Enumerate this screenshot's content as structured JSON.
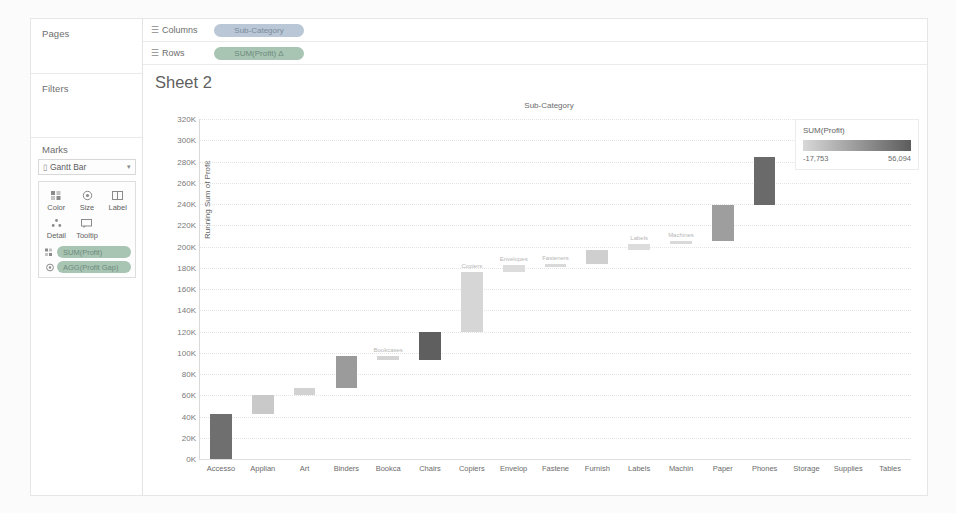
{
  "left_panel": {
    "pages_label": "Pages",
    "filters_label": "Filters",
    "marks_label": "Marks",
    "mark_type": "Gantt Bar",
    "mark_type_icon": "gantt-bar-icon",
    "caret_icon": "▾",
    "buttons": [
      {
        "label": "Color",
        "icon": "color-icon"
      },
      {
        "label": "Size",
        "icon": "size-icon"
      },
      {
        "label": "Label",
        "icon": "label-icon"
      },
      {
        "label": "Detail",
        "icon": "detail-icon"
      },
      {
        "label": "Tooltip",
        "icon": "tooltip-icon"
      }
    ],
    "mark_pills": [
      {
        "text": "SUM(Profit)",
        "shelf": "Color",
        "type": "green"
      },
      {
        "text": "AGG(Profit Gap)",
        "shelf": "Size",
        "type": "green"
      }
    ]
  },
  "shelves": [
    {
      "label": "Columns",
      "icon": "columns-icon",
      "pill": "Sub-Category",
      "type": "blue"
    },
    {
      "label": "Rows",
      "icon": "rows-icon",
      "pill": "SUM(Profit) Δ",
      "type": "green"
    }
  ],
  "view": {
    "sheet_title": "Sheet 2",
    "column_header": "Sub-Category"
  },
  "legend": {
    "title": "SUM(Profit)",
    "min": "-17,753",
    "max": "56,094",
    "ramp_from": "#d8d8d8",
    "ramp_to": "#5c5c5c"
  },
  "chart_data": {
    "type": "bar",
    "chart_variant": "waterfall",
    "title": "Sheet 2",
    "xlabel": "Sub-Category",
    "ylabel": "Running Sum of Profit",
    "ylim": [
      0,
      320000
    ],
    "ytick_step": 20000,
    "ytick_labels": [
      "0K",
      "20K",
      "40K",
      "60K",
      "80K",
      "100K",
      "120K",
      "140K",
      "160K",
      "180K",
      "200K",
      "220K",
      "240K",
      "260K",
      "280K",
      "300K",
      "320K"
    ],
    "grid": true,
    "legend_position": "right",
    "categories": [
      "Accesso",
      "Applian",
      "Art",
      "Binders",
      "Bookca",
      "Chairs",
      "Copiers",
      "Envelop",
      "Fastene",
      "Furnish",
      "Labels",
      "Machin",
      "Paper",
      "Phones",
      "Storage",
      "Supplies",
      "Tables"
    ],
    "category_labels_full": [
      "Accessories",
      "Appliances",
      "Art",
      "Binders",
      "Bookcases",
      "Chairs",
      "Copiers",
      "Envelopes",
      "Fasteners",
      "Furnishings",
      "Labels",
      "Machines",
      "Paper",
      "Phones",
      "Storage",
      "Supplies",
      "Tables"
    ],
    "values": [
      41937,
      18138,
      6528,
      30222,
      -3473,
      26590,
      55618,
      6964,
      949,
      13059,
      5546,
      3385,
      34054,
      44516,
      21279,
      -1189,
      -17725
    ],
    "running_start": [
      0,
      41937,
      60075,
      66603,
      96825,
      93352,
      119942,
      175560,
      182524,
      183473,
      196532,
      202078,
      205463,
      239517,
      284033,
      305312,
      304123
    ],
    "running_end": [
      41937,
      60075,
      66603,
      96825,
      93352,
      119942,
      175560,
      182524,
      183473,
      196532,
      202078,
      205463,
      239517,
      284033,
      305312,
      304123,
      286398
    ],
    "bar_colors": [
      "#6f6f6f",
      "#c9c9c9",
      "#d2d2d2",
      "#9b9b9b",
      "#d4d4d4",
      "#5f5f5f",
      "#d6d6d6",
      "#dcdcdc",
      "#d9d9d9",
      "#cfcfcf",
      "#dcdcdc",
      "#dadada",
      "#9e9e9e",
      "#6a6a6a",
      "#bdbdbd",
      "#dddddd",
      "#c4c4c4"
    ],
    "mark_labels": [
      {
        "category": "Bookca",
        "text": "Bookcases"
      },
      {
        "category": "Copiers",
        "text": "Copiers"
      },
      {
        "category": "Envelop",
        "text": "Envelopes"
      },
      {
        "category": "Fastene",
        "text": "Fasteners"
      },
      {
        "category": "Labels",
        "text": "Labels"
      },
      {
        "category": "Machin",
        "text": "Machines"
      },
      {
        "category": "Supplies",
        "text": "Supplies"
      },
      {
        "category": "Tables",
        "text": "Tables"
      }
    ],
    "color_encoding_field": "SUM(Profit)",
    "color_min": -17753,
    "color_max": 56094
  }
}
